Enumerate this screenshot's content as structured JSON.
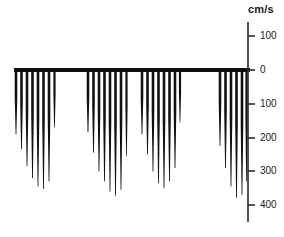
{
  "axis": {
    "unit_label": "cm/s",
    "unit_label_x": 248,
    "unit_label_y": 3,
    "line_x": 248,
    "line_top_y": 22,
    "line_bottom_y": 222,
    "tick_length": 7,
    "label_offset_x": 12,
    "zero_y": 70,
    "px_per_100": 33.8,
    "ticks": [
      {
        "value": "100",
        "y": 36
      },
      {
        "value": "0",
        "y": 70
      },
      {
        "value": "100",
        "y": 104
      },
      {
        "value": "200",
        "y": 138
      },
      {
        "value": "300",
        "y": 171
      },
      {
        "value": "400",
        "y": 205
      }
    ]
  },
  "baseline": {
    "y": 70,
    "x_start": 14,
    "x_end": 250,
    "thickness": 4
  },
  "colors": {
    "trace": "#111111",
    "axis": "#2a2a2a",
    "text": "#1a1a1a",
    "background": "#ffffff"
  },
  "chart_data": {
    "type": "line",
    "title": "",
    "subtitle": "",
    "xlabel": "",
    "ylabel": "cm/s",
    "ylim": [
      100,
      -420
    ],
    "y_ticks": [
      100,
      0,
      -100,
      -200,
      -300,
      -400
    ],
    "grid": false,
    "legend": "none",
    "annotations": [],
    "series": [
      {
        "name": "cluster-1",
        "spikes": [
          {
            "x": 16,
            "peak_velocity": -190,
            "width": 2.6
          },
          {
            "x": 21.5,
            "peak_velocity": -235,
            "width": 2.6
          },
          {
            "x": 27,
            "peak_velocity": -285,
            "width": 2.6
          },
          {
            "x": 32.5,
            "peak_velocity": -320,
            "width": 2.6
          },
          {
            "x": 38,
            "peak_velocity": -345,
            "width": 2.6
          },
          {
            "x": 43.5,
            "peak_velocity": -352,
            "width": 2.6
          },
          {
            "x": 49,
            "peak_velocity": -330,
            "width": 2.6
          },
          {
            "x": 54.5,
            "peak_velocity": -170,
            "width": 2.2
          }
        ]
      },
      {
        "name": "cluster-2",
        "spikes": [
          {
            "x": 88,
            "peak_velocity": -185,
            "width": 2.6
          },
          {
            "x": 93.5,
            "peak_velocity": -245,
            "width": 2.6
          },
          {
            "x": 99,
            "peak_velocity": -300,
            "width": 2.6
          },
          {
            "x": 104.5,
            "peak_velocity": -330,
            "width": 2.6
          },
          {
            "x": 110,
            "peak_velocity": -360,
            "width": 2.6
          },
          {
            "x": 115.5,
            "peak_velocity": -372,
            "width": 2.6
          },
          {
            "x": 121,
            "peak_velocity": -355,
            "width": 2.6
          },
          {
            "x": 126.5,
            "peak_velocity": -255,
            "width": 2.2
          }
        ]
      },
      {
        "name": "cluster-3",
        "spikes": [
          {
            "x": 142,
            "peak_velocity": -190,
            "width": 2.6
          },
          {
            "x": 147.5,
            "peak_velocity": -250,
            "width": 2.6
          },
          {
            "x": 153,
            "peak_velocity": -300,
            "width": 2.6
          },
          {
            "x": 158.5,
            "peak_velocity": -335,
            "width": 2.6
          },
          {
            "x": 164,
            "peak_velocity": -350,
            "width": 2.6
          },
          {
            "x": 169.5,
            "peak_velocity": -330,
            "width": 2.6
          },
          {
            "x": 175,
            "peak_velocity": -290,
            "width": 2.6
          },
          {
            "x": 180,
            "peak_velocity": -155,
            "width": 2.2
          }
        ]
      },
      {
        "name": "cluster-4",
        "spikes": [
          {
            "x": 220,
            "peak_velocity": -225,
            "width": 2.6
          },
          {
            "x": 225.5,
            "peak_velocity": -290,
            "width": 2.6
          },
          {
            "x": 231,
            "peak_velocity": -345,
            "width": 2.6
          },
          {
            "x": 236.5,
            "peak_velocity": -378,
            "width": 2.6
          },
          {
            "x": 242,
            "peak_velocity": -370,
            "width": 2.6
          },
          {
            "x": 246.5,
            "peak_velocity": -330,
            "width": 2.2
          }
        ]
      }
    ]
  }
}
